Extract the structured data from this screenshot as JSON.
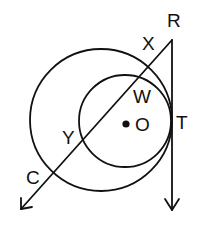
{
  "diagram": {
    "type": "geometry",
    "stroke_color": "#111111",
    "background": "#ffffff",
    "circles": [
      {
        "name": "outer",
        "cx": 101,
        "cy": 120,
        "r": 71
      },
      {
        "name": "inner",
        "cx": 125,
        "cy": 121,
        "r": 46
      }
    ],
    "center_point": {
      "label": "O",
      "x": 126,
      "y": 124
    },
    "points": [
      {
        "label": "R",
        "x": 172,
        "y": 40
      },
      {
        "label": "X",
        "x": 148,
        "y": 67
      },
      {
        "label": "W",
        "x": 138,
        "y": 77
      },
      {
        "label": "T",
        "x": 171,
        "y": 120
      },
      {
        "label": "Y",
        "x": 83,
        "y": 138
      },
      {
        "label": "C",
        "x": 53,
        "y": 174
      }
    ],
    "rays": [
      {
        "name": "ray-RC",
        "from": "R",
        "x1": 172,
        "y1": 40,
        "x2": 21,
        "y2": 209
      },
      {
        "name": "ray-RT",
        "from": "R",
        "x1": 172,
        "y1": 40,
        "x2": 172,
        "y2": 210
      }
    ]
  },
  "labels": {
    "R": "R",
    "X": "X",
    "W": "W",
    "O": "O",
    "T": "T",
    "Y": "Y",
    "C": "C"
  }
}
